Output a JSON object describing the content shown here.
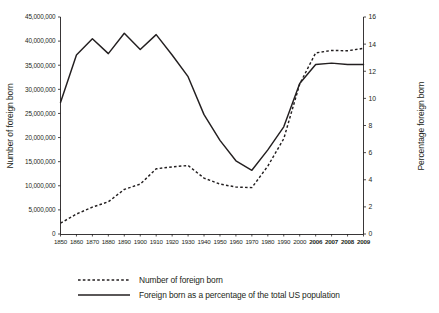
{
  "chart_data": {
    "type": "line",
    "title": "",
    "xlabel": "",
    "ylabel": "Number of foreign born",
    "y2label": "Percentage foreign born",
    "grid": false,
    "legend_position": "bottom",
    "categories": [
      "1850",
      "1860",
      "1870",
      "1880",
      "1890",
      "1900",
      "1910",
      "1920",
      "1930",
      "1940",
      "1950",
      "1960",
      "1970",
      "1980",
      "1990",
      "2000",
      "2006",
      "2007",
      "2008",
      "2009"
    ],
    "bold_categories": [
      "2006",
      "2007",
      "2008",
      "2009"
    ],
    "ylim": [
      0,
      45000000
    ],
    "yticks": [
      0,
      5000000,
      10000000,
      15000000,
      20000000,
      25000000,
      30000000,
      35000000,
      40000000,
      45000000
    ],
    "ytick_labels": [
      "0",
      "5,000,000",
      "10,000,000",
      "15,000,000",
      "20,000,000",
      "25,000,000",
      "30,000,000",
      "35,000,000",
      "40,000,000",
      "45,000,000"
    ],
    "y2lim": [
      0,
      16
    ],
    "y2ticks": [
      0,
      2,
      4,
      6,
      8,
      10,
      12,
      14,
      16
    ],
    "y2tick_labels": [
      "0",
      "2",
      "4",
      "6",
      "8",
      "10",
      "12",
      "14",
      "16"
    ],
    "series": [
      {
        "name": "Number of foreign born",
        "style": "dashed",
        "axis": "left",
        "values": [
          2244000,
          4139000,
          5567000,
          6680000,
          9250000,
          10341000,
          13516000,
          13921000,
          14204000,
          11595000,
          10347000,
          9738000,
          9619000,
          14080000,
          19767000,
          31108000,
          37548000,
          38060000,
          38000000,
          38500000
        ]
      },
      {
        "name": "Foreign born as a percentage of the total US population",
        "style": "solid",
        "axis": "right",
        "values": [
          9.7,
          13.2,
          14.4,
          13.3,
          14.8,
          13.6,
          14.7,
          13.2,
          11.6,
          8.8,
          6.9,
          5.4,
          4.7,
          6.2,
          7.9,
          11.1,
          12.5,
          12.6,
          12.5,
          12.5
        ]
      }
    ]
  },
  "legend": {
    "items": [
      {
        "label": "Number of foreign born",
        "style": "dashed"
      },
      {
        "label": "Foreign born as a percentage of the total US population",
        "style": "solid"
      }
    ]
  }
}
